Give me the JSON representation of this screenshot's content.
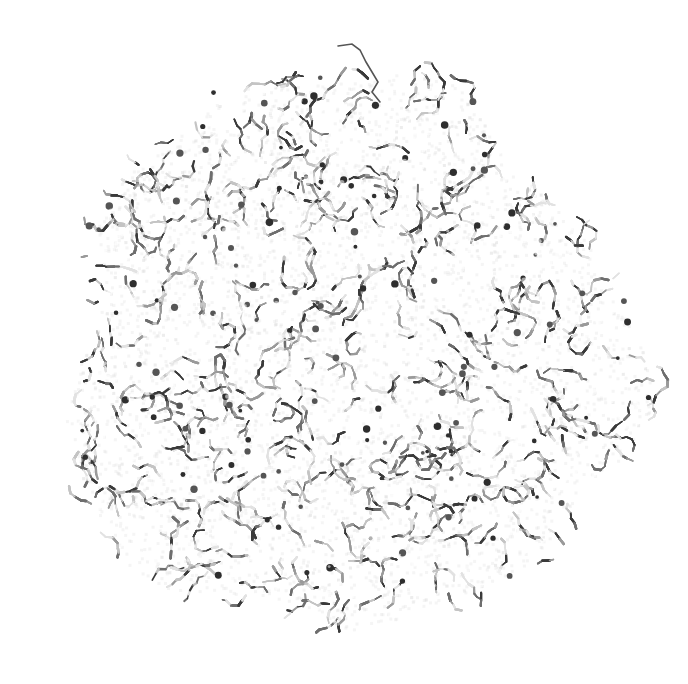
{
  "image": {
    "subject": "molecular-cluster-render",
    "style": "grayscale ball-and-stick",
    "background_color": "#ffffff",
    "bond_colors": [
      "#3a3a3a",
      "#6e6e6e",
      "#9a9a9a",
      "#c4c4c4",
      "#e2e2e2"
    ],
    "center": [
      345,
      355
    ],
    "radius_x": 292,
    "radius_y": 285
  }
}
